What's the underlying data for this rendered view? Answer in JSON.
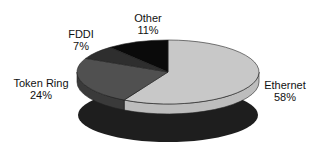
{
  "chart_data": {
    "type": "pie",
    "style": "3d",
    "title": "",
    "categories": [
      "Ethernet",
      "Token Ring",
      "FDDI",
      "Other"
    ],
    "values": [
      58,
      24,
      7,
      11
    ],
    "value_labels": [
      "58%",
      "24%",
      "7%",
      "11%"
    ],
    "colors": [
      "#c8c8c8",
      "#505050",
      "#2e2e2e",
      "#0a0a0a"
    ],
    "side_colors": [
      "#bdbdbd",
      "#3a3a3a",
      "#262626",
      "#050505"
    ],
    "shadow_color": "#1e1e1e",
    "legend": "none (direct labels)"
  },
  "labels": {
    "ethernet": {
      "name": "Ethernet",
      "pct": "58%"
    },
    "token_ring": {
      "name": "Token Ring",
      "pct": "24%"
    },
    "fddi": {
      "name": "FDDI",
      "pct": "7%"
    },
    "other": {
      "name": "Other",
      "pct": "11%"
    }
  }
}
